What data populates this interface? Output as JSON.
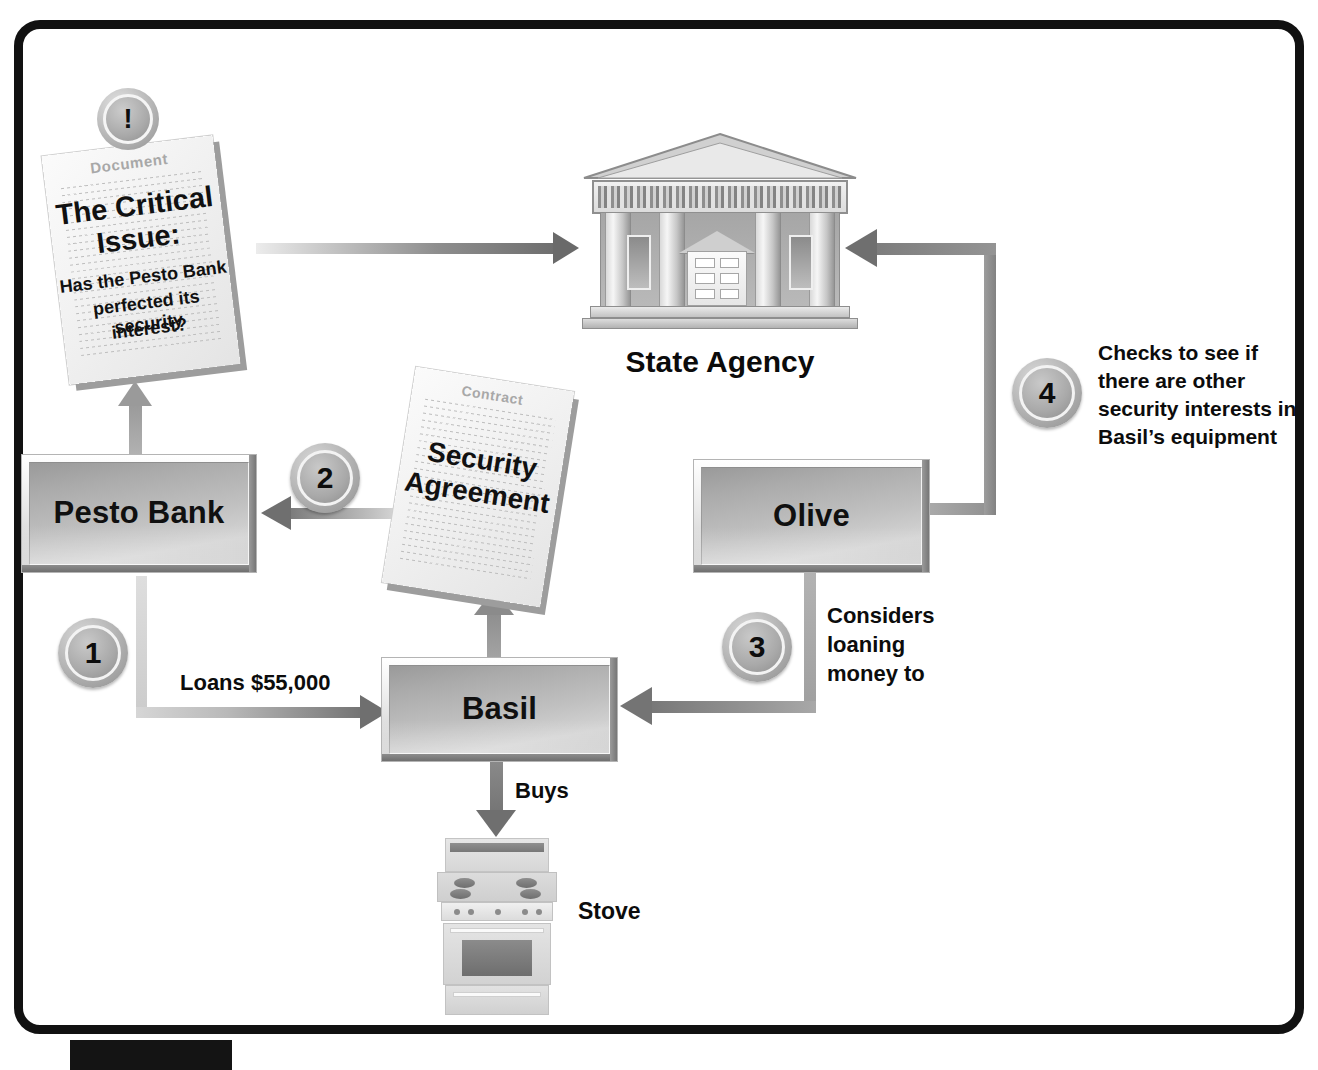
{
  "diagram": {
    "title_nodes": {
      "pesto_bank": "Pesto Bank",
      "basil": "Basil",
      "olive": "Olive",
      "state_agency": "State Agency",
      "stove": "Stove"
    },
    "document_card": {
      "kind_label": "Document",
      "heading_line1": "The Critical",
      "heading_line2": "Issue:",
      "question_line1": "Has the Pesto Bank",
      "question_line2": "perfected its security",
      "question_line3": "interest?",
      "badge": "!"
    },
    "contract_card": {
      "kind_label": "Contract",
      "title_line1": "Security",
      "title_line2": "Agreement"
    },
    "steps": [
      {
        "number": "1",
        "label": "Loans $55,000"
      },
      {
        "number": "2",
        "label": ""
      },
      {
        "number": "3",
        "label_line1": "Considers",
        "label_line2": "loaning",
        "label_line3": "money to"
      },
      {
        "number": "4",
        "label_line1": "Checks to see if",
        "label_line2": "there are other",
        "label_line3": "security interests in",
        "label_line4": "Basil’s equipment"
      }
    ],
    "edge_labels": {
      "buys": "Buys"
    },
    "colors": {
      "frame": "#111111",
      "arrow_dark": "#6f6f6f",
      "arrow_light": "#d2d2d2",
      "node_fill": "#b9b9b9",
      "text": "#0c0c0c"
    }
  }
}
